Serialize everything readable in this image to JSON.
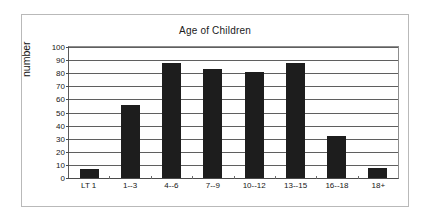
{
  "chart_data": {
    "type": "bar",
    "title": "Age of Children",
    "xlabel": "",
    "ylabel": "number",
    "categories": [
      "LT 1",
      "1--3",
      "4--6",
      "7--9",
      "10--12",
      "13--15",
      "16--18",
      "18+"
    ],
    "values": [
      7,
      56,
      88,
      83,
      81,
      88,
      32,
      8
    ],
    "ylim": [
      0,
      100
    ],
    "ytick_labels": [
      "100",
      "90",
      "80",
      "70",
      "60",
      "50",
      "40",
      "30",
      "20",
      "10",
      "0"
    ],
    "ytick_values": [
      100,
      90,
      80,
      70,
      60,
      50,
      40,
      30,
      20,
      10,
      0
    ],
    "grid": true,
    "legend": false,
    "bar_color": "#1d1d1d",
    "gridline_color": "#5f5f5f",
    "background_color": "#ffffff",
    "frame_color": "#b9b9b9"
  }
}
